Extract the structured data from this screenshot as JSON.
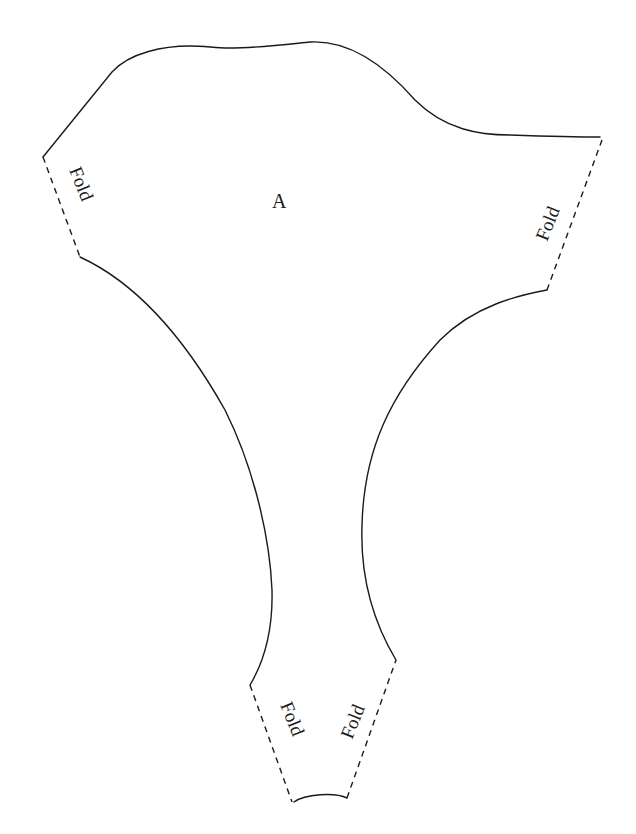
{
  "diagram": {
    "type": "sewing-pattern-piece",
    "piece_label": "A",
    "colors": {
      "line": "#1a1a1a",
      "background": "#ffffff"
    },
    "fold_labels": [
      {
        "id": "left-top",
        "text": "Fold"
      },
      {
        "id": "right-top",
        "text": "Fold"
      },
      {
        "id": "bottom-left",
        "text": "Fold"
      },
      {
        "id": "bottom-right",
        "text": "Fold"
      }
    ]
  }
}
